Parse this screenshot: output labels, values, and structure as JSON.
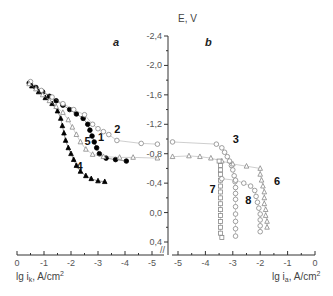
{
  "chart_data": {
    "type": "scatter",
    "title": "",
    "yaxis": {
      "label": "E, V",
      "ticks": [
        -2.4,
        -2.0,
        -1.6,
        -1.2,
        -0.8,
        -0.4,
        0.0,
        0.4
      ],
      "tick_labels": [
        "-2,4",
        "-2,0",
        "-1,6",
        "-1,2",
        "-0,8",
        "-0,4",
        "0,0",
        "0,4"
      ],
      "range": [
        -2.4,
        0.4
      ],
      "inverted": true
    },
    "panels": [
      {
        "id": "a",
        "label": "a",
        "xlabel": "lg i",
        "xlabel_sub": "k",
        "xlabel_unit": ", A/cm",
        "xlabel_sup": "2",
        "xticks": [
          0,
          -1,
          -2,
          -3,
          -4,
          -5
        ],
        "xrange": [
          0,
          -5.4
        ],
        "series": [
          {
            "name": "1",
            "marker": "filled-circle",
            "color": "#000000",
            "points": [
              [
                -0.45,
                -1.76
              ],
              [
                -0.7,
                -1.7
              ],
              [
                -0.95,
                -1.64
              ],
              [
                -1.2,
                -1.58
              ],
              [
                -1.45,
                -1.52
              ],
              [
                -1.7,
                -1.46
              ],
              [
                -1.95,
                -1.4
              ],
              [
                -2.2,
                -1.34
              ],
              [
                -2.45,
                -1.28
              ],
              [
                -2.62,
                -1.2
              ],
              [
                -2.7,
                -1.12
              ],
              [
                -2.78,
                -1.04
              ],
              [
                -2.86,
                -0.96
              ],
              [
                -2.95,
                -0.88
              ],
              [
                -3.05,
                -0.8
              ],
              [
                -3.3,
                -0.74
              ],
              [
                -3.65,
                -0.72
              ],
              [
                -4.05,
                -0.7
              ]
            ],
            "label_pos": [
              -3.0,
              -0.97
            ]
          },
          {
            "name": "2",
            "marker": "open-circle",
            "color": "#888888",
            "points": [
              [
                -0.5,
                -1.78
              ],
              [
                -0.9,
                -1.66
              ],
              [
                -1.3,
                -1.57
              ],
              [
                -1.7,
                -1.48
              ],
              [
                -2.1,
                -1.4
              ],
              [
                -2.5,
                -1.33
              ],
              [
                -2.8,
                -1.2
              ],
              [
                -3.0,
                -1.14
              ],
              [
                -3.2,
                -1.1
              ],
              [
                -3.4,
                -1.06
              ],
              [
                -3.7,
                -0.98
              ],
              [
                -4.6,
                -0.94
              ],
              [
                -5.2,
                -0.93
              ]
            ],
            "label_pos": [
              -3.6,
              -1.08
            ]
          },
          {
            "name": "4",
            "marker": "filled-triangle",
            "color": "#000000",
            "points": [
              [
                -0.55,
                -1.72
              ],
              [
                -0.8,
                -1.64
              ],
              [
                -1.05,
                -1.56
              ],
              [
                -1.3,
                -1.48
              ],
              [
                -1.5,
                -1.38
              ],
              [
                -1.62,
                -1.28
              ],
              [
                -1.68,
                -1.18
              ],
              [
                -1.74,
                -1.08
              ],
              [
                -1.8,
                -0.98
              ],
              [
                -1.9,
                -0.88
              ],
              [
                -2.0,
                -0.8
              ],
              [
                -2.1,
                -0.72
              ],
              [
                -2.2,
                -0.64
              ],
              [
                -2.35,
                -0.56
              ],
              [
                -2.55,
                -0.5
              ],
              [
                -2.75,
                -0.46
              ],
              [
                -3.0,
                -0.43
              ],
              [
                -3.25,
                -0.42
              ]
            ],
            "label_pos": [
              -2.2,
              -0.58
            ]
          },
          {
            "name": "5",
            "marker": "open-triangle",
            "color": "#888888",
            "points": [
              [
                -0.45,
                -1.75
              ],
              [
                -0.7,
                -1.68
              ],
              [
                -0.95,
                -1.6
              ],
              [
                -1.2,
                -1.52
              ],
              [
                -1.45,
                -1.44
              ],
              [
                -1.7,
                -1.36
              ],
              [
                -1.9,
                -1.26
              ],
              [
                -2.05,
                -1.16
              ],
              [
                -2.2,
                -1.06
              ],
              [
                -2.35,
                -0.96
              ],
              [
                -2.55,
                -0.86
              ],
              [
                -2.8,
                -0.79
              ],
              [
                -3.2,
                -0.76
              ],
              [
                -3.8,
                -0.75
              ],
              [
                -4.3,
                -0.75
              ],
              [
                -5.2,
                -0.74
              ]
            ],
            "label_pos": [
              -2.5,
              -0.92
            ]
          }
        ]
      },
      {
        "id": "b",
        "label": "b",
        "xlabel": "lg i",
        "xlabel_sub": "a",
        "xlabel_unit": ", A/cm",
        "xlabel_sup": "2",
        "xticks": [
          -5,
          -4,
          -3,
          -2,
          -1,
          0
        ],
        "xrange": [
          -5.4,
          0
        ],
        "series": [
          {
            "name": "3",
            "marker": "open-circle",
            "color": "#888888",
            "points": [
              [
                -5.2,
                -0.96
              ],
              [
                -3.6,
                -0.93
              ],
              [
                -3.4,
                -0.88
              ],
              [
                -3.3,
                -0.82
              ],
              [
                -3.2,
                -0.76
              ],
              [
                -3.12,
                -0.7
              ],
              [
                -3.05,
                -0.64
              ],
              [
                -3.0,
                -0.58
              ],
              [
                -2.95,
                -0.5
              ],
              [
                -2.92,
                -0.42
              ],
              [
                -2.9,
                -0.34
              ],
              [
                -2.9,
                -0.26
              ],
              [
                -2.9,
                -0.18
              ],
              [
                -2.9,
                -0.08
              ],
              [
                -2.9,
                0.02
              ],
              [
                -2.9,
                0.12
              ],
              [
                -2.9,
                0.22
              ],
              [
                -2.9,
                0.32
              ]
            ],
            "label_pos": [
              -3.0,
              -0.95
            ]
          },
          {
            "name": "6",
            "marker": "open-triangle",
            "color": "#888888",
            "points": [
              [
                -5.2,
                -0.76
              ],
              [
                -4.6,
                -0.77
              ],
              [
                -4.2,
                -0.76
              ],
              [
                -3.8,
                -0.74
              ],
              [
                -3.4,
                -0.7
              ],
              [
                -3.0,
                -0.66
              ],
              [
                -2.5,
                -0.63
              ],
              [
                -2.0,
                -0.6
              ],
              [
                -2.0,
                -0.52
              ],
              [
                -1.95,
                -0.44
              ],
              [
                -1.9,
                -0.36
              ],
              [
                -1.85,
                -0.28
              ],
              [
                -1.85,
                -0.2
              ],
              [
                -1.85,
                -0.12
              ],
              [
                -1.8,
                -0.04
              ],
              [
                -1.8,
                0.04
              ],
              [
                -1.75,
                0.12
              ],
              [
                -1.75,
                0.2
              ]
            ],
            "label_pos": [
              -1.5,
              -0.37
            ]
          },
          {
            "name": "7",
            "marker": "open-square",
            "color": "#888888",
            "points": [
              [
                -3.5,
                -0.7
              ],
              [
                -3.45,
                -0.64
              ],
              [
                -3.45,
                -0.58
              ],
              [
                -3.45,
                -0.52
              ],
              [
                -3.45,
                -0.44
              ],
              [
                -3.45,
                -0.36
              ],
              [
                -3.45,
                -0.28
              ],
              [
                -3.45,
                -0.2
              ],
              [
                -3.45,
                -0.12
              ],
              [
                -3.45,
                -0.04
              ],
              [
                -3.45,
                0.04
              ],
              [
                -3.45,
                0.12
              ],
              [
                -3.45,
                0.2
              ],
              [
                -3.45,
                0.28
              ],
              [
                -3.4,
                0.34
              ]
            ],
            "label_pos": [
              -3.85,
              -0.27
            ]
          },
          {
            "name": "8",
            "marker": "open-circle",
            "color": "#888888",
            "points": [
              [
                -3.4,
                -0.46
              ],
              [
                -2.9,
                -0.44
              ],
              [
                -2.6,
                -0.4
              ],
              [
                -2.35,
                -0.36
              ],
              [
                -2.2,
                -0.3
              ],
              [
                -2.15,
                -0.22
              ],
              [
                -2.1,
                -0.14
              ],
              [
                -2.05,
                -0.06
              ],
              [
                -2.0,
                0.02
              ],
              [
                -2.0,
                0.1
              ],
              [
                -2.0,
                0.18
              ],
              [
                -2.0,
                0.26
              ]
            ],
            "label_pos": [
              -2.55,
              -0.12
            ]
          }
        ]
      }
    ]
  },
  "labels": {
    "y_title": "E, V",
    "panel_a": "a",
    "panel_b": "b",
    "x_title_left": "lg i",
    "x_title_left_sub": "k",
    "x_title_right": "lg i",
    "x_title_right_sub": "a",
    "x_unit": ", A/cm",
    "x_unit_sup": "2"
  }
}
